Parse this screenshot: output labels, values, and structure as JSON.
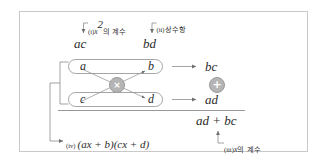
{
  "figure": {
    "type": "cross-multiplication-factoring-diagram",
    "border_color": "#c9c9c9",
    "node_color": "#b5b5b5",
    "line_color": "#8c8c8c",
    "text_color": "#2b2b2b"
  },
  "top": {
    "left_product": "ac",
    "right_product": "bd",
    "left_callout_marker": "(i)",
    "left_callout_text": "의 계수",
    "left_callout_var": "x",
    "left_callout_exp": "2",
    "right_callout_marker": "(ii)",
    "right_callout_text": "상수항"
  },
  "box_top": {
    "left_term": "a",
    "right_term": "b"
  },
  "box_bottom": {
    "left_term": "c",
    "right_term": "d"
  },
  "cross_node": {
    "symbol": "×",
    "label": "multiply"
  },
  "plus_node": {
    "symbol": "+",
    "label": "add"
  },
  "right": {
    "upper_product": "bc",
    "lower_product": "ad",
    "sum": "ad + bc",
    "callout_marker": "(iii)",
    "callout_var": "x",
    "callout_text": "의 계수"
  },
  "bottom": {
    "callout_marker": "(iv)",
    "result": "(ax + b)(cx + d)"
  }
}
